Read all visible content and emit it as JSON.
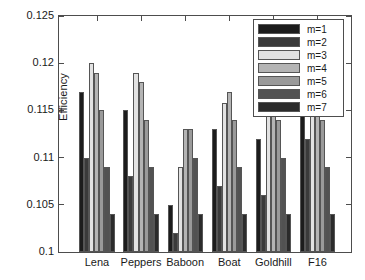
{
  "chart_data": {
    "type": "bar",
    "title": "",
    "xlabel": "",
    "ylabel": "Efficiency",
    "categories": [
      "Lena",
      "Peppers",
      "Baboon",
      "Boat",
      "Goldhill",
      "F16"
    ],
    "ylim": [
      0.1,
      0.125
    ],
    "yticks": [
      0.1,
      0.105,
      0.11,
      0.115,
      0.12,
      0.125
    ],
    "ytick_labels": [
      "0.1",
      "0.105",
      "0.11",
      "0.115",
      "0.12",
      "0.125"
    ],
    "grid": false,
    "legend_position": "top-right",
    "series": [
      {
        "name": "m=1",
        "color": "#1c1c1c",
        "values": [
          0.117,
          0.115,
          0.105,
          0.113,
          0.112,
          0.118
        ]
      },
      {
        "name": "m=2",
        "color": "#3a3a3a",
        "values": [
          0.11,
          0.108,
          0.102,
          0.107,
          0.106,
          0.112
        ]
      },
      {
        "name": "m=3",
        "color": "#e2e2e2",
        "values": [
          0.12,
          0.119,
          0.109,
          0.1158,
          0.117,
          0.12
        ]
      },
      {
        "name": "m=4",
        "color": "#b4b4b4",
        "values": [
          0.119,
          0.118,
          0.113,
          0.117,
          0.118,
          0.118
        ]
      },
      {
        "name": "m=5",
        "color": "#9a9a9a",
        "values": [
          0.115,
          0.114,
          0.113,
          0.114,
          0.114,
          0.114
        ]
      },
      {
        "name": "m=6",
        "color": "#525252",
        "values": [
          0.109,
          0.109,
          0.11,
          0.109,
          0.11,
          0.109
        ]
      },
      {
        "name": "m=7",
        "color": "#2b2b2b",
        "values": [
          0.104,
          0.104,
          0.104,
          0.104,
          0.104,
          0.104
        ]
      }
    ]
  },
  "legend": {
    "entries": [
      "m=1",
      "m=2",
      "m=3",
      "m=4",
      "m=5",
      "m=6",
      "m=7"
    ]
  }
}
